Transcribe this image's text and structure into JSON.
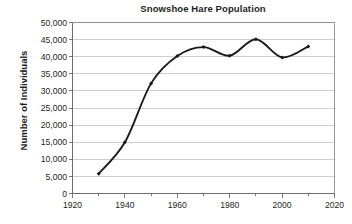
{
  "chart_data": {
    "type": "line",
    "title": "Snowshoe Hare Population",
    "xlabel": "",
    "ylabel": "Number of Individuals",
    "x": [
      1930,
      1940,
      1950,
      1960,
      1970,
      1980,
      1990,
      2000,
      2010
    ],
    "values": [
      5800,
      15000,
      32200,
      40200,
      42800,
      40300,
      45100,
      39800,
      43000
    ],
    "series": [
      {
        "name": "Snowshoe Hare Population",
        "values": [
          5800,
          15000,
          32200,
          40200,
          42800,
          40300,
          45100,
          39800,
          43000
        ]
      }
    ],
    "xlim": [
      1920,
      2020
    ],
    "ylim": [
      0,
      50000
    ],
    "x_tick_labels": [
      "1920",
      "1940",
      "1960",
      "1980",
      "2000",
      "2020"
    ],
    "x_tick_values": [
      1920,
      1940,
      1960,
      1980,
      2000,
      2020
    ],
    "x_minor_tick_values": [
      1930,
      1950,
      1970,
      1990,
      2010
    ],
    "y_tick_labels": [
      "0",
      "5,000",
      "10,000",
      "15,000",
      "20,000",
      "25,000",
      "30,000",
      "35,000",
      "40,000",
      "45,000",
      "50,000"
    ],
    "y_tick_values": [
      0,
      5000,
      10000,
      15000,
      20000,
      25000,
      30000,
      35000,
      40000,
      45000,
      50000
    ],
    "grid": "horizontal",
    "legend": "none",
    "line_color": "#1a1a1a",
    "grid_color": "#b9b9b9",
    "border_color": "#8d8d8d",
    "marker": "diamond",
    "smoothing": true
  }
}
